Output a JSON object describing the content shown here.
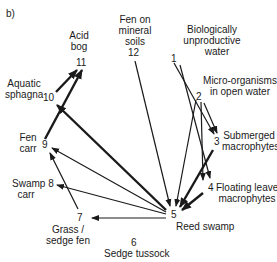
{
  "panel_label": "b)",
  "nodes": [
    {
      "id": "1",
      "label_lines": [
        "Biologically",
        "unproductive",
        "water"
      ]
    },
    {
      "id": "2",
      "label_lines": [
        "Micro-organisms",
        "in open water"
      ]
    },
    {
      "id": "3",
      "label_lines": [
        "Submerged",
        "macrophytes"
      ]
    },
    {
      "id": "4",
      "label_lines": [
        "Floating leaved",
        "macrophytes"
      ]
    },
    {
      "id": "5",
      "label_lines": [
        "Reed swamp"
      ]
    },
    {
      "id": "6",
      "label_lines": [
        "Sedge tussock"
      ]
    },
    {
      "id": "7",
      "label_lines": [
        "Grass /",
        "sedge fen"
      ]
    },
    {
      "id": "8",
      "label_lines": [
        "Swamp",
        "carr"
      ]
    },
    {
      "id": "9",
      "label_lines": [
        "Fen",
        "carr"
      ]
    },
    {
      "id": "10",
      "label_lines": [
        "Aquatic",
        "sphagna"
      ]
    },
    {
      "id": "11",
      "label_lines": [
        "Acid",
        "bog"
      ]
    },
    {
      "id": "12",
      "label_lines": [
        "Fen on",
        "mineral",
        "soils"
      ]
    }
  ],
  "edges": [
    {
      "from": "1",
      "to": "3",
      "weight": "thin"
    },
    {
      "from": "1",
      "to": "4",
      "weight": "thin"
    },
    {
      "from": "2",
      "to": "3",
      "weight": "thin"
    },
    {
      "from": "2",
      "to": "4",
      "weight": "thin"
    },
    {
      "from": "2",
      "to": "5",
      "weight": "thin"
    },
    {
      "from": "3",
      "to": "5",
      "weight": "thick"
    },
    {
      "from": "4",
      "to": "5",
      "weight": "thick"
    },
    {
      "from": "12",
      "to": "5",
      "weight": "thin"
    },
    {
      "from": "5",
      "to": "7",
      "weight": "thin"
    },
    {
      "from": "5",
      "to": "8",
      "weight": "thin"
    },
    {
      "from": "5",
      "to": "9",
      "weight": "thin"
    },
    {
      "from": "5",
      "to": "10",
      "weight": "thick"
    },
    {
      "from": "7",
      "to": "9",
      "weight": "thin"
    },
    {
      "from": "10",
      "to": "11",
      "weight": "thick"
    },
    {
      "from": "9",
      "to": "11",
      "weight": "thick"
    }
  ]
}
